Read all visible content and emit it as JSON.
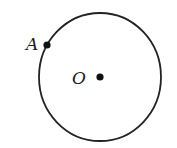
{
  "diagram": {
    "type": "circle-with-points",
    "circle": {
      "cx": 100,
      "cy": 77,
      "rx": 61,
      "ry": 64,
      "stroke": "#222222",
      "stroke_width": 1.8
    },
    "points": [
      {
        "id": "A",
        "label": "A",
        "x": 47,
        "y": 45,
        "label_x": 26,
        "label_y": 49,
        "on_circle": true
      },
      {
        "id": "O",
        "label": "O",
        "x": 100,
        "y": 77,
        "label_x": 73,
        "label_y": 84,
        "is_center": true
      }
    ],
    "point_color": "#111111"
  }
}
